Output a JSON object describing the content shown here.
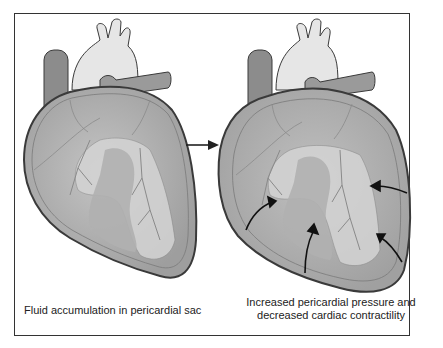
{
  "diagram": {
    "panels": [
      {
        "id": "left",
        "caption": "Fluid accumulation in pericardial sac"
      },
      {
        "id": "right",
        "caption_line1": "Increased pericardial pressure and",
        "caption_line2": "decreased cardiac contractility"
      }
    ],
    "transition_arrow": "right-arrow",
    "pressure_arrows_count": 5,
    "colors": {
      "outline": "#3a3a3a",
      "pericardium_fill": "#a8a8a8",
      "heart_fill": "#bdbdbd",
      "vessel_fill": "#e6e6e6",
      "vein_fill": "#8c8c8c",
      "artery_fill": "#9a9a9a",
      "highlight": "#d9d9d9"
    }
  }
}
